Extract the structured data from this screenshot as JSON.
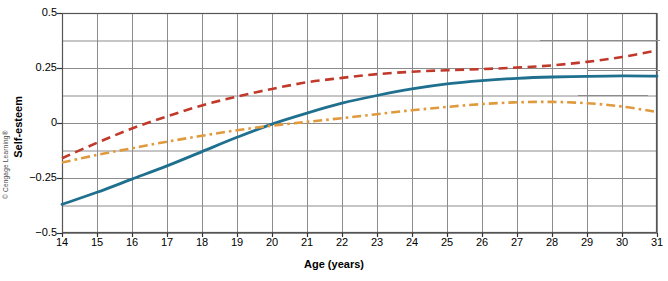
{
  "credit": "© Cengage Learning®",
  "chart_data": {
    "type": "line",
    "title": "",
    "xlabel": "Age (years)",
    "ylabel": "Self-esteem",
    "xlim": [
      14,
      31
    ],
    "ylim": [
      -0.5,
      0.5
    ],
    "grid": true,
    "legend_position": "right-inline-labels",
    "x_tick_labels": [
      "14",
      "15",
      "16",
      "17",
      "18",
      "19",
      "20",
      "21",
      "22",
      "23",
      "24",
      "25",
      "26",
      "27",
      "28",
      "29",
      "30",
      "31"
    ],
    "y_tick_labels": [
      "0.5",
      "0.25",
      "0",
      "-0.25",
      "-0.5"
    ],
    "y_tick_values": [
      0.5,
      0.25,
      0,
      -0.25,
      -0.5
    ],
    "y_gridline_values": [
      0.5,
      0.375,
      0.25,
      0.125,
      0,
      -0.125,
      -0.25,
      -0.375,
      -0.5
    ],
    "x": [
      14,
      15,
      16,
      17,
      18,
      19,
      20,
      21,
      22,
      23,
      24,
      25,
      26,
      27,
      28,
      29,
      30,
      31
    ],
    "series": [
      {
        "name": "African American",
        "color": "#c0392b",
        "style": "dashed",
        "values": [
          -0.16,
          -0.09,
          -0.025,
          0.03,
          0.08,
          0.12,
          0.155,
          0.185,
          0.205,
          0.222,
          0.233,
          0.24,
          0.245,
          0.252,
          0.262,
          0.278,
          0.3,
          0.33
        ]
      },
      {
        "name": "Hispanic",
        "color": "#1f6f8f",
        "style": "solid",
        "values": [
          -0.37,
          -0.315,
          -0.255,
          -0.195,
          -0.13,
          -0.065,
          -0.005,
          0.045,
          0.09,
          0.125,
          0.155,
          0.178,
          0.193,
          0.203,
          0.209,
          0.212,
          0.214,
          0.213
        ]
      },
      {
        "name": "White",
        "color": "#e09a3e",
        "style": "dash-dot",
        "values": [
          -0.18,
          -0.145,
          -0.115,
          -0.085,
          -0.058,
          -0.033,
          -0.012,
          0.005,
          0.022,
          0.04,
          0.058,
          0.073,
          0.086,
          0.094,
          0.096,
          0.09,
          0.075,
          0.05
        ]
      }
    ]
  }
}
